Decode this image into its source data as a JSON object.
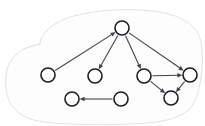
{
  "figure": {
    "type": "node-link-diagram",
    "background_color": "#ffffff",
    "node_fill": "#ffffff",
    "node_stroke": "#1b1b20",
    "edge_color": "#42424a",
    "blob_stroke": "#e2e2e4",
    "blob_fill": "#fdfdfd",
    "node_radius": 7,
    "canvas": {
      "width": 205,
      "height": 126
    }
  },
  "nodes": [
    {
      "id": "n1",
      "name": "node-top",
      "label": "",
      "cx": 122,
      "cy": 28
    },
    {
      "id": "n2",
      "name": "node-far-left",
      "label": "",
      "cx": 48,
      "cy": 75
    },
    {
      "id": "n3",
      "name": "node-mid-left",
      "label": "",
      "cx": 95,
      "cy": 76
    },
    {
      "id": "n4",
      "name": "node-mid-right",
      "label": "",
      "cx": 144,
      "cy": 76
    },
    {
      "id": "n5",
      "name": "node-far-right",
      "label": "",
      "cx": 190,
      "cy": 75
    },
    {
      "id": "n6",
      "name": "node-bottom-right",
      "label": "",
      "cx": 171,
      "cy": 98
    },
    {
      "id": "n7",
      "name": "node-bottom-left",
      "label": "",
      "cx": 72,
      "cy": 99
    },
    {
      "id": "n8",
      "name": "node-bottom-mid",
      "label": "",
      "cx": 121,
      "cy": 99
    }
  ],
  "edges": [
    {
      "id": "e1",
      "name": "edge-far-left-to-top",
      "from": "n2",
      "to": "n1",
      "directed": true
    },
    {
      "id": "e2",
      "name": "edge-top-to-mid-left",
      "from": "n1",
      "to": "n3",
      "directed": true
    },
    {
      "id": "e3",
      "name": "edge-top-to-mid-right",
      "from": "n1",
      "to": "n4",
      "directed": true
    },
    {
      "id": "e4",
      "name": "edge-top-to-far-right",
      "from": "n1",
      "to": "n5",
      "directed": true
    },
    {
      "id": "e5",
      "name": "edge-mid-right-to-far-right",
      "from": "n4",
      "to": "n5",
      "directed": true
    },
    {
      "id": "e6",
      "name": "edge-mid-right-to-bottom-right",
      "from": "n4",
      "to": "n6",
      "directed": true
    },
    {
      "id": "e7",
      "name": "edge-far-right-to-bottom-right",
      "from": "n5",
      "to": "n6",
      "directed": true
    },
    {
      "id": "e8",
      "name": "edge-bottom-mid-to-bottom-left",
      "from": "n8",
      "to": "n7",
      "directed": true
    }
  ],
  "blob": {
    "name": "enclosing-region-outline",
    "path": "M 40 44 C 40 34 52 22 74 16 C 100 9 134 8 160 12 C 182 16 198 26 201 42 C 204 58 202 82 196 99 C 190 114 174 121 146 123 C 110 126 62 125 38 121 C 18 117 8 106 6 88 C 4 70 10 56 24 49 C 30 46 36 45 40 44 Z",
    "accent_path": "M 40 44 C 34 45 28 47 24 49"
  }
}
